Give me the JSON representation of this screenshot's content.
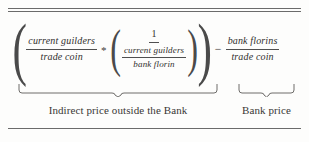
{
  "figure": {
    "kind": "equation-figure",
    "ink_color": "#32302e",
    "rule_color": "#6b6b6b",
    "background": "#fdfdfc"
  },
  "equation": {
    "group_open": "(",
    "term1": {
      "numerator": "current guilders",
      "denominator": "trade coin"
    },
    "multiply_operator": "*",
    "inner_open": "(",
    "term2": {
      "numerator": "1",
      "denominator_fraction": {
        "numerator": "current guilders",
        "denominator": "bank florin"
      }
    },
    "inner_close": ")",
    "group_close": ")",
    "minus_operator": "−",
    "term3": {
      "numerator": "bank florins",
      "denominator": "trade coin"
    }
  },
  "annotations": {
    "left_brace_label": "Indirect price outside the Bank",
    "right_brace_label": "Bank price"
  }
}
